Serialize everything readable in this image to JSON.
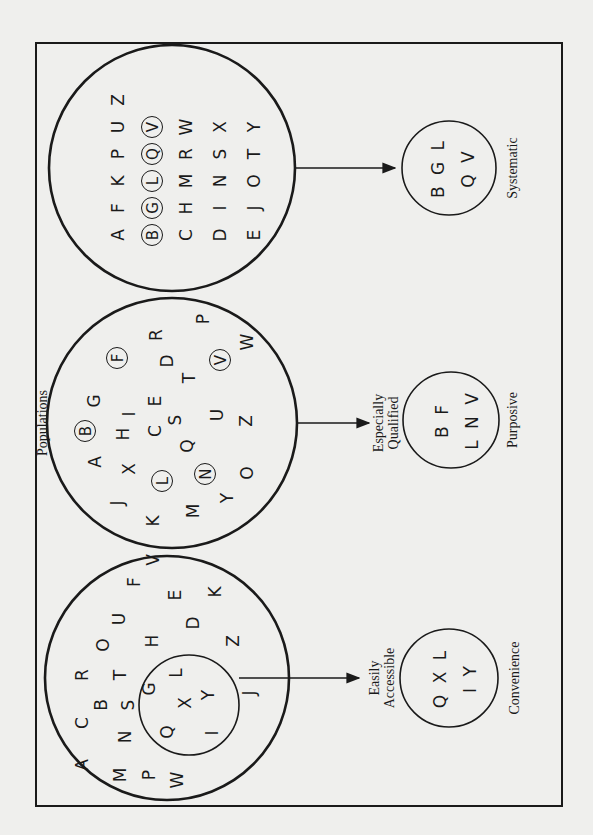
{
  "diagram": {
    "heading": "Populations",
    "orientation": "rotated -90deg (landscape diagram printed sideways)",
    "panels": [
      {
        "id": "convenience",
        "method_label": "Convenience",
        "arrow_label_line1": "Easily",
        "arrow_label_line2": "Accessible",
        "population_letters": [
          "A",
          "B",
          "C",
          "D",
          "E",
          "F",
          "G",
          "H",
          "I",
          "J",
          "K",
          "L",
          "M",
          "N",
          "O",
          "P",
          "Q",
          "R",
          "S",
          "T",
          "U",
          "V",
          "W",
          "X",
          "Y",
          "Z"
        ],
        "subgroup_letters": [
          "Q",
          "X",
          "L",
          "I",
          "Y"
        ],
        "sample_row1": "Q X L",
        "sample_row2": "I Y"
      },
      {
        "id": "purposive",
        "method_label": "Purposive",
        "arrow_label_line1": "Especially",
        "arrow_label_line2": "Qualified",
        "population_letters": [
          "A",
          "B",
          "C",
          "D",
          "E",
          "F",
          "G",
          "H",
          "I",
          "J",
          "K",
          "L",
          "M",
          "N",
          "O",
          "P",
          "Q",
          "R",
          "S",
          "T",
          "U",
          "V",
          "W",
          "X",
          "Y",
          "Z"
        ],
        "circled_letters": [
          "B",
          "F",
          "L",
          "N",
          "V"
        ],
        "sample_row1": "B F",
        "sample_row2": "L N V"
      },
      {
        "id": "systematic",
        "method_label": "Systematic",
        "population_grid": [
          [
            "A",
            "B",
            "C",
            "D",
            "E"
          ],
          [
            "F",
            "G",
            "H",
            "I",
            "J"
          ],
          [
            "K",
            "L",
            "M",
            "N",
            "O"
          ],
          [
            "P",
            "Q",
            "R",
            "S",
            "T"
          ],
          [
            "U",
            "V",
            "W",
            "X",
            "Y"
          ],
          [
            "Z"
          ]
        ],
        "circled_letters": [
          "B",
          "G",
          "L",
          "Q",
          "V"
        ],
        "sample_row1": "B G L",
        "sample_row2": "Q V"
      }
    ]
  },
  "layout": {
    "convenience_letters": [
      {
        "t": "A",
        "x": 40,
        "y": 45
      },
      {
        "t": "C",
        "x": 82,
        "y": 45
      },
      {
        "t": "R",
        "x": 130,
        "y": 45
      },
      {
        "t": "M",
        "x": 30,
        "y": 83
      },
      {
        "t": "N",
        "x": 68,
        "y": 88
      },
      {
        "t": "B",
        "x": 100,
        "y": 64
      },
      {
        "t": "S",
        "x": 100,
        "y": 91
      },
      {
        "t": "T",
        "x": 130,
        "y": 83
      },
      {
        "t": "O",
        "x": 160,
        "y": 66
      },
      {
        "t": "U",
        "x": 186,
        "y": 82
      },
      {
        "t": "F",
        "x": 223,
        "y": 97
      },
      {
        "t": "V",
        "x": 245,
        "y": 116
      },
      {
        "t": "P",
        "x": 30,
        "y": 112
      },
      {
        "t": "G",
        "x": 116,
        "y": 112
      },
      {
        "t": "H",
        "x": 164,
        "y": 115
      },
      {
        "t": "E",
        "x": 210,
        "y": 138
      },
      {
        "t": "K",
        "x": 213,
        "y": 178
      },
      {
        "t": "D",
        "x": 182,
        "y": 156
      },
      {
        "t": "W",
        "x": 25,
        "y": 140
      },
      {
        "t": "Z",
        "x": 164,
        "y": 196
      },
      {
        "t": "J",
        "x": 112,
        "y": 212
      }
    ],
    "convenience_sub_letters": [
      {
        "t": "Q",
        "x": 73,
        "y": 130
      },
      {
        "t": "X",
        "x": 102,
        "y": 148
      },
      {
        "t": "L",
        "x": 132,
        "y": 139
      },
      {
        "t": "I",
        "x": 72,
        "y": 175
      },
      {
        "t": "Y",
        "x": 110,
        "y": 171
      }
    ],
    "purposive_letters": [
      {
        "t": "A",
        "x": 343,
        "y": 58
      },
      {
        "t": "B",
        "x": 374,
        "y": 48,
        "ring": true
      },
      {
        "t": "G",
        "x": 404,
        "y": 57
      },
      {
        "t": "F",
        "x": 447,
        "y": 80,
        "ring": true
      },
      {
        "t": "R",
        "x": 470,
        "y": 119
      },
      {
        "t": "J",
        "x": 302,
        "y": 80
      },
      {
        "t": "X",
        "x": 336,
        "y": 92
      },
      {
        "t": "H",
        "x": 371,
        "y": 86
      },
      {
        "t": "I",
        "x": 391,
        "y": 92
      },
      {
        "t": "E",
        "x": 404,
        "y": 118
      },
      {
        "t": "D",
        "x": 444,
        "y": 130
      },
      {
        "t": "P",
        "x": 486,
        "y": 166
      },
      {
        "t": "K",
        "x": 284,
        "y": 116
      },
      {
        "t": "L",
        "x": 324,
        "y": 125,
        "ring": true
      },
      {
        "t": "C",
        "x": 374,
        "y": 118
      },
      {
        "t": "S",
        "x": 385,
        "y": 138
      },
      {
        "t": "T",
        "x": 427,
        "y": 152
      },
      {
        "t": "V",
        "x": 445,
        "y": 183,
        "ring": true
      },
      {
        "t": "M",
        "x": 294,
        "y": 156
      },
      {
        "t": "Q",
        "x": 359,
        "y": 150
      },
      {
        "t": "U",
        "x": 390,
        "y": 180
      },
      {
        "t": "W",
        "x": 463,
        "y": 210
      },
      {
        "t": "Y",
        "x": 307,
        "y": 190
      },
      {
        "t": "N",
        "x": 331,
        "y": 168,
        "ring": true
      },
      {
        "t": "Z",
        "x": 384,
        "y": 209
      },
      {
        "t": "O",
        "x": 332,
        "y": 210
      }
    ]
  }
}
